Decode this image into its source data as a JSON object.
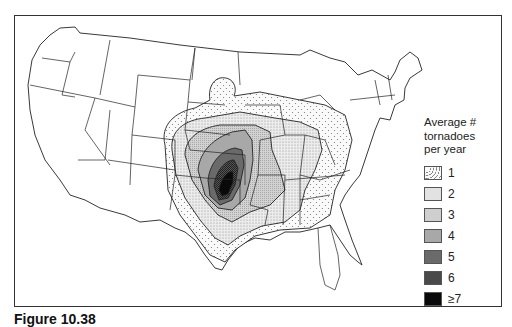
{
  "figure": {
    "caption": "Figure 10.38"
  },
  "legend": {
    "title_lines": [
      "Average #",
      "tornadoes",
      "per year"
    ],
    "items": [
      {
        "label": "1",
        "fill": "dotted-light",
        "color": "#f4f4f4"
      },
      {
        "label": "2",
        "fill": "stipple-light",
        "color": "#e2e2e2"
      },
      {
        "label": "3",
        "fill": "stipple-medium",
        "color": "#cfcfcf"
      },
      {
        "label": "4",
        "fill": "gray",
        "color": "#a8a8a8"
      },
      {
        "label": "5",
        "fill": "dark-gray",
        "color": "#6a6a6a"
      },
      {
        "label": "6",
        "fill": "hatched-dark",
        "color": "#4a4a4a"
      },
      {
        "label": "≥7",
        "fill": "black",
        "color": "#0a0a0a"
      }
    ]
  },
  "map": {
    "region": "Contiguous United States",
    "max_zone": "Oklahoma / north Texas",
    "colors": {
      "border": "#222222",
      "frame": "#333333",
      "land": "#ffffff"
    }
  }
}
